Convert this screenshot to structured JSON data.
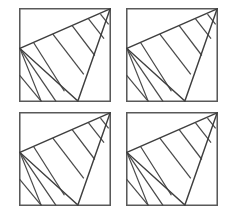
{
  "figure": {
    "panel_count": 4,
    "grid_rows": 2,
    "grid_columns": 2,
    "canvas": {
      "width": 236,
      "height": 218
    },
    "colors": {
      "background": "#ffffff",
      "frame_stroke": "#595959",
      "figure_stroke": "#4a4a4a",
      "outline_stroke": "#3f3f3f"
    },
    "panels": [
      {
        "id": "panel-top-left",
        "label": "Top left panel",
        "position": {
          "x": 19,
          "y": 8,
          "width": 92,
          "height": 94
        }
      },
      {
        "id": "panel-top-right",
        "label": "Top right panel",
        "position": {
          "x": 126,
          "y": 8,
          "width": 92,
          "height": 94
        }
      },
      {
        "id": "panel-bottom-left",
        "label": "Bottom left panel",
        "position": {
          "x": 19,
          "y": 112,
          "width": 92,
          "height": 94
        }
      },
      {
        "id": "panel-bottom-right",
        "label": "Bottom right panel",
        "position": {
          "x": 126,
          "y": 112,
          "width": 92,
          "height": 94
        }
      }
    ],
    "geometry": {
      "viewbox": {
        "width": 100,
        "height": 100
      },
      "triangle_vertices": {
        "apex": [
          99,
          1
        ],
        "left": [
          1,
          43
        ],
        "bottom": [
          64,
          99
        ]
      },
      "outline_path": "M 99 1 L 1 43 L 64 99 Z",
      "stripe_segments": [
        {
          "name": "stripe-1",
          "from": [
            1,
            43
          ],
          "to": [
            24,
            99
          ]
        },
        {
          "name": "stripe-2",
          "from": [
            16,
            37
          ],
          "to": [
            49,
            88
          ]
        },
        {
          "name": "stripe-3",
          "from": [
            37,
            28
          ],
          "to": [
            70,
            70
          ]
        },
        {
          "name": "stripe-4",
          "from": [
            58,
            19
          ],
          "to": [
            82,
            50
          ]
        },
        {
          "name": "stripe-5",
          "from": [
            76,
            12
          ],
          "to": [
            92,
            32
          ]
        },
        {
          "name": "stripe-6",
          "from": [
            89,
            7
          ],
          "to": [
            97,
            17
          ]
        }
      ],
      "lower_segments": [
        {
          "name": "lower-fan-1",
          "from": [
            1,
            43
          ],
          "to": [
            40,
            99
          ]
        },
        {
          "name": "lower-fan-2",
          "from": [
            1,
            72
          ],
          "to": [
            24,
            99
          ]
        }
      ],
      "description_notes": "Apex sits at the upper-right corner of the square; the left vertex touches the left edge; the bottom vertex touches the bottom edge. Parallel stripe lines run from the upper hypotenuse down to the lower-right edge."
    }
  }
}
